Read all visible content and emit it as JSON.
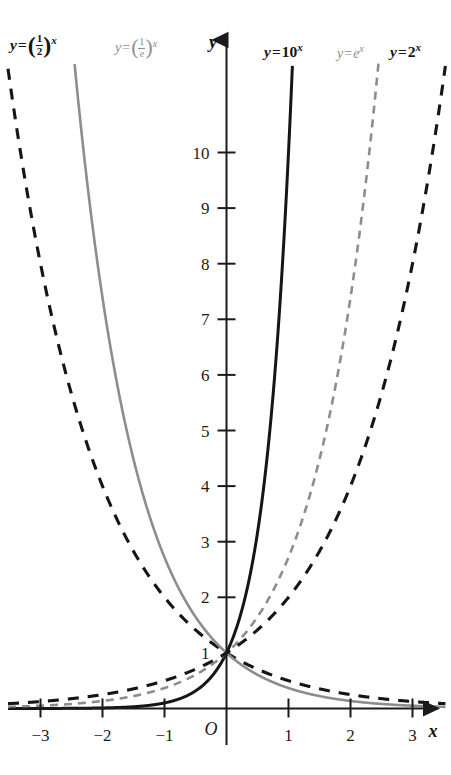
{
  "chart_data": {
    "type": "line",
    "title": "",
    "subtitle": "",
    "xlabel": "x",
    "ylabel": "y",
    "xlim": [
      -3.35,
      3.35
    ],
    "ylim": [
      -0.25,
      10.65
    ],
    "grid": false,
    "legend_position": "inline-curve-labels",
    "x_ticks": [
      -3,
      -2,
      -1,
      1,
      2,
      3
    ],
    "x_tick_labels": [
      "−3",
      "−2",
      "−1",
      "1",
      "2",
      "3"
    ],
    "y_ticks": [
      1,
      2,
      3,
      4,
      5,
      6,
      7,
      8,
      9,
      10
    ],
    "y_tick_labels": [
      "1",
      "2",
      "3",
      "4",
      "5",
      "6",
      "7",
      "8",
      "9",
      "10"
    ],
    "origin_label": "O",
    "annotations": [
      {
        "text": "y = (1/2)^x",
        "x": -3.0,
        "y": 10.6
      },
      {
        "text": "y = (1/e)^x",
        "x": -1.85,
        "y": 10.45
      },
      {
        "text": "y = 10^x",
        "x": 0.85,
        "y": 10.55
      },
      {
        "text": "y = e^x",
        "x": 2.05,
        "y": 10.45
      },
      {
        "text": "y = 2^x",
        "x": 2.85,
        "y": 10.55
      }
    ],
    "series": [
      {
        "name": "y = (1/2)^x",
        "base": 0.5,
        "formula": "y=(1/2)^x",
        "color": "#151515",
        "style": "dashed",
        "width": 3.1,
        "label_color_name": "black"
      },
      {
        "name": "y = (1/e)^x",
        "base": 0.36787944117,
        "formula": "y=(1/e)^x",
        "color": "#8d8d8d",
        "style": "solid",
        "width": 2.6,
        "label_color_name": "gray"
      },
      {
        "name": "y = 10^x",
        "base": 10,
        "formula": "y=10^x",
        "color": "#151515",
        "style": "solid",
        "width": 3.0,
        "label_color_name": "black"
      },
      {
        "name": "y = e^x",
        "base": 2.71828182846,
        "formula": "y=e^x",
        "color": "#8d8d8d",
        "style": "dashed",
        "width": 2.6,
        "label_color_name": "gray"
      },
      {
        "name": "y = 2^x",
        "base": 2,
        "formula": "y=2^x",
        "color": "#151515",
        "style": "dashed",
        "width": 3.1,
        "label_color_name": "black"
      }
    ],
    "common_point": {
      "x": 0,
      "y": 1,
      "note": "all curves pass through (0, 1)"
    }
  },
  "labels": {
    "half": {
      "y": "y",
      "eq": "=",
      "num": "1",
      "den": "2",
      "exp": "x"
    },
    "inv_e": {
      "y": "y",
      "eq": "=",
      "num": "1",
      "den": "e",
      "exp": "x"
    },
    "ten": {
      "y": "y",
      "eq": "=",
      "base": "10",
      "exp": "x"
    },
    "e": {
      "y": "y",
      "eq": "=",
      "base": "e",
      "exp": "x"
    },
    "two": {
      "y": "y",
      "eq": "=",
      "base": "2",
      "exp": "x"
    }
  },
  "axes": {
    "y_axis_name": "y",
    "x_axis_name": "x",
    "origin": "O"
  },
  "colors": {
    "dark_curve": "#151515",
    "light_curve": "#8d8d8d",
    "axis": "#1b1b1b",
    "background": "#ffffff"
  }
}
